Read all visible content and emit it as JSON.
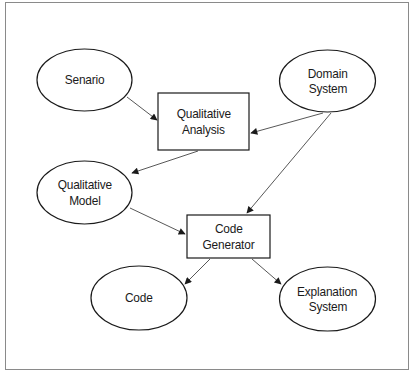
{
  "diagram": {
    "type": "flowchart",
    "colors": {
      "stroke": "#1a1a1a",
      "edge": "#444444",
      "frame": "#8a8a8a",
      "background": "#ffffff"
    },
    "nodes": {
      "senario": {
        "shape": "ellipse",
        "lines": [
          "Senario"
        ]
      },
      "domain_system": {
        "shape": "ellipse",
        "lines": [
          "Domain",
          "System"
        ]
      },
      "qualitative_analysis": {
        "shape": "rectangle",
        "lines": [
          "Qualitative",
          "Analysis"
        ]
      },
      "qualitative_model": {
        "shape": "ellipse",
        "lines": [
          "Qualitative",
          "Model"
        ]
      },
      "code_generator": {
        "shape": "rectangle",
        "lines": [
          "Code",
          "Generator"
        ]
      },
      "code": {
        "shape": "ellipse",
        "lines": [
          "Code"
        ]
      },
      "explanation_system": {
        "shape": "ellipse",
        "lines": [
          "Explanation",
          "System"
        ]
      }
    },
    "edges": [
      {
        "from": "Senario",
        "to": "Qualitative Analysis"
      },
      {
        "from": "Domain System",
        "to": "Qualitative Analysis"
      },
      {
        "from": "Qualitative Analysis",
        "to": "Qualitative Model"
      },
      {
        "from": "Domain System",
        "to": "Code Generator"
      },
      {
        "from": "Qualitative Model",
        "to": "Code Generator"
      },
      {
        "from": "Code Generator",
        "to": "Code"
      },
      {
        "from": "Code Generator",
        "to": "Explanation System"
      }
    ]
  }
}
